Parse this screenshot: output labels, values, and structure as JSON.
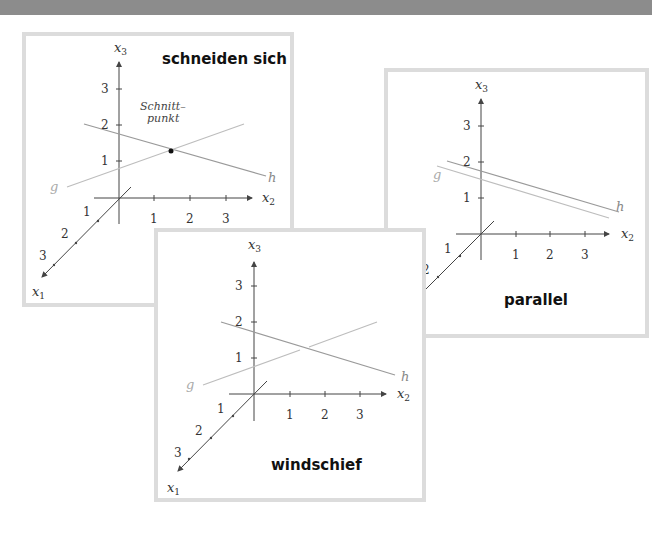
{
  "colors": {
    "band": "#8c8c8c",
    "panel_border": "#dcdcdc",
    "axis": "#444444",
    "line_h": "#9a9a9a",
    "line_g": "#bdbdbd",
    "label_g": "#aaaaaa"
  },
  "axis_labels": {
    "x1": "x",
    "x2": "x",
    "x3": "x",
    "sub1": "1",
    "sub2": "2",
    "sub3": "3"
  },
  "ticks": {
    "t1": "1",
    "t2": "2",
    "t3": "3"
  },
  "line_labels": {
    "g": "g",
    "h": "h"
  },
  "panels": {
    "intersecting": {
      "caption": "schneiden sich",
      "point_label_line1": "Schnitt–",
      "point_label_line2": "punkt"
    },
    "parallel": {
      "caption": "parallel"
    },
    "skew": {
      "caption": "windschief"
    }
  }
}
